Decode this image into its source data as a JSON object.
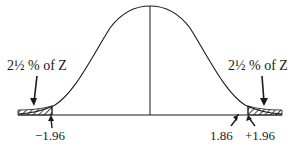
{
  "diagram": {
    "type": "normal-distribution",
    "left_tail_label": "2½ % of Z",
    "right_tail_label": "2½ % of Z",
    "tick_labels": {
      "left_critical": "−1.96",
      "marked_value": "1.86",
      "right_critical": "+1.96"
    },
    "colors": {
      "ink": "#1a1a1a",
      "background": "#ffffff"
    }
  }
}
